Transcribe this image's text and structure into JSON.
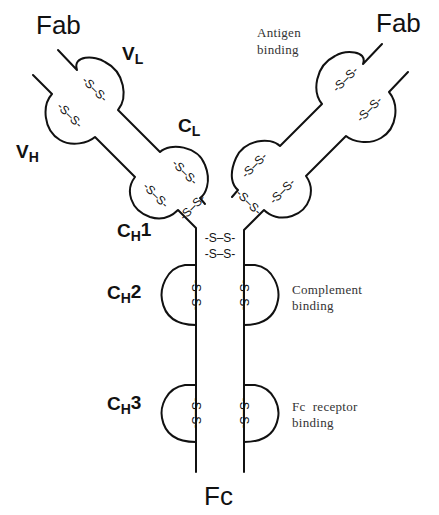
{
  "diagram": {
    "region_labels": {
      "fab_left": "Fab",
      "fab_right": "Fab",
      "fc": "Fc"
    },
    "domain_labels": {
      "vl": {
        "main": "V",
        "sub": "L"
      },
      "cl": {
        "main": "C",
        "sub": "L"
      },
      "vh": {
        "main": "V",
        "sub": "H"
      },
      "ch1": {
        "main": "C",
        "sub": "H",
        "num": "1"
      },
      "ch2": {
        "main": "C",
        "sub": "H",
        "num": "2"
      },
      "ch3": {
        "main": "C",
        "sub": "H",
        "num": "3"
      }
    },
    "annotations": {
      "antigen_binding": [
        "Antigen",
        "binding"
      ],
      "complement_binding": [
        "Complement",
        "binding"
      ],
      "fc_receptor_binding": [
        "Fc  receptor",
        "binding"
      ]
    },
    "disulfide_bond": "-S–S-",
    "hinge_bonds": [
      "-S–S-",
      "-S–S-"
    ],
    "colors": {
      "line": "#111111",
      "annotation_text": "#333333",
      "background": "#ffffff"
    }
  }
}
